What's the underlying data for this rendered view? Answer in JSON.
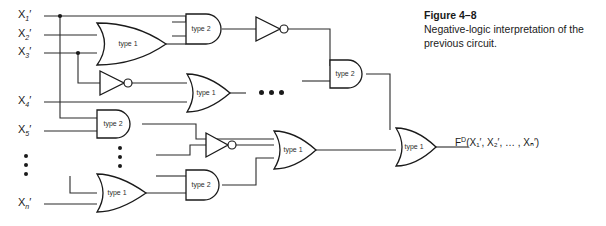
{
  "figure": {
    "number": "Figure  4–8",
    "caption": "Negative-logic interpretation of the previous circuit."
  },
  "inputs": [
    {
      "name": "x1",
      "base": "X",
      "sub": "1",
      "prime": "′"
    },
    {
      "name": "x2",
      "base": "X",
      "sub": "2",
      "prime": "′"
    },
    {
      "name": "x3",
      "base": "X",
      "sub": "3",
      "prime": "′"
    },
    {
      "name": "x4",
      "base": "X",
      "sub": "4",
      "prime": "′"
    },
    {
      "name": "x5",
      "base": "X",
      "sub": "5",
      "prime": "′"
    },
    {
      "name": "xn",
      "base": "X",
      "sub": "n",
      "prime": "′"
    }
  ],
  "output": {
    "func": "F",
    "superscript": "D",
    "args": "(X₁′, X₂′, … , Xₙ′)",
    "full": "Fᴰ(X₁′, X₂′, … , Xₙ′)"
  },
  "gates": [
    {
      "id": "g1",
      "label": "type 1",
      "kind": "or"
    },
    {
      "id": "g2",
      "label": "type 2",
      "kind": "and"
    },
    {
      "id": "g3",
      "label": "type 1",
      "kind": "or"
    },
    {
      "id": "g4",
      "label": "type 2",
      "kind": "and"
    },
    {
      "id": "g5",
      "label": "type 2",
      "kind": "and"
    },
    {
      "id": "g6",
      "label": "type 1",
      "kind": "or"
    },
    {
      "id": "g7",
      "label": "type 2",
      "kind": "and"
    },
    {
      "id": "g8",
      "label": "type 1",
      "kind": "or"
    },
    {
      "id": "g9",
      "label": "type 1",
      "kind": "or"
    }
  ],
  "inverters": [
    {
      "id": "inv1"
    },
    {
      "id": "inv2"
    },
    {
      "id": "inv3"
    }
  ],
  "colors": {
    "ink": "#1a1a1a",
    "wire": "#2b2b2b",
    "background": "#ffffff"
  }
}
